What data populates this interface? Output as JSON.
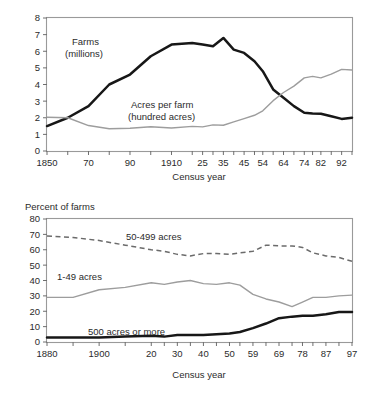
{
  "chart_data": [
    {
      "id": "farms-and-acres",
      "type": "line",
      "title": "",
      "xlabel": "Census year",
      "ylabel": "",
      "xlim": [
        1850,
        1997
      ],
      "ylim": [
        0,
        8
      ],
      "yticks": [
        0,
        1,
        2,
        3,
        4,
        5,
        6,
        7,
        8
      ],
      "ytick_labels": [
        "0",
        "1",
        "2",
        "3",
        "4",
        "5",
        "6",
        "7",
        "8"
      ],
      "xtick_values": [
        1850,
        1860,
        1870,
        1880,
        1890,
        1900,
        1910,
        1920,
        1925,
        1930,
        1935,
        1940,
        1945,
        1950,
        1954,
        1959,
        1964,
        1969,
        1974,
        1978,
        1982,
        1987,
        1992,
        1997
      ],
      "xtick_labels": [
        "1850",
        "",
        "70",
        "",
        "90",
        "",
        "1910",
        "",
        "25",
        "",
        "35",
        "",
        "45",
        "",
        "54",
        "",
        "64",
        "",
        "74",
        "",
        "82",
        "",
        "92",
        ""
      ],
      "grid": false,
      "legend_position": "inline-annotation",
      "series": [
        {
          "name": "Farms (millions)",
          "style": "thick-dark",
          "label_line1": "Farms",
          "label_line2": "(millions)",
          "x": [
            1850,
            1860,
            1870,
            1880,
            1890,
            1900,
            1910,
            1920,
            1925,
            1930,
            1935,
            1940,
            1945,
            1950,
            1954,
            1959,
            1964,
            1969,
            1974,
            1978,
            1982,
            1987,
            1992,
            1997
          ],
          "values": [
            1.5,
            2.0,
            2.7,
            4.0,
            4.6,
            5.7,
            6.4,
            6.5,
            6.4,
            6.3,
            6.8,
            6.1,
            5.9,
            5.4,
            4.8,
            3.7,
            3.2,
            2.7,
            2.3,
            2.26,
            2.24,
            2.09,
            1.93,
            2.0
          ]
        },
        {
          "name": "Acres per farm (hundred acres)",
          "style": "thin-gray",
          "label_line1": "Acres per farm",
          "label_line2": "(hundred acres)",
          "x": [
            1850,
            1860,
            1870,
            1880,
            1890,
            1900,
            1910,
            1920,
            1925,
            1930,
            1935,
            1940,
            1945,
            1950,
            1954,
            1959,
            1964,
            1969,
            1974,
            1978,
            1982,
            1987,
            1992,
            1997
          ],
          "values": [
            2.03,
            2.0,
            1.53,
            1.34,
            1.37,
            1.46,
            1.38,
            1.48,
            1.45,
            1.57,
            1.55,
            1.75,
            1.95,
            2.15,
            2.42,
            3.03,
            3.52,
            3.9,
            4.4,
            4.49,
            4.4,
            4.62,
            4.91,
            4.87
          ]
        }
      ]
    },
    {
      "id": "percent-of-farms-by-size",
      "type": "line",
      "title": "Percent of farms",
      "xlabel": "Census year",
      "ylabel": "",
      "xlim": [
        1880,
        1997
      ],
      "ylim": [
        0,
        80
      ],
      "yticks": [
        0,
        10,
        20,
        30,
        40,
        50,
        60,
        70,
        80
      ],
      "ytick_labels": [
        "0",
        "10",
        "20",
        "30",
        "40",
        "50",
        "60",
        "70",
        "80"
      ],
      "xtick_values": [
        1880,
        1890,
        1900,
        1910,
        1920,
        1925,
        1930,
        1935,
        1940,
        1945,
        1950,
        1954,
        1959,
        1964,
        1969,
        1974,
        1978,
        1982,
        1987,
        1992,
        1997
      ],
      "xtick_labels": [
        "1880",
        "",
        "1900",
        "",
        "20",
        "",
        "30",
        "",
        "40",
        "",
        "50",
        "",
        "59",
        "",
        "69",
        "",
        "78",
        "",
        "87",
        "",
        "97"
      ],
      "grid": false,
      "legend_position": "inline-annotation",
      "series": [
        {
          "name": "50-499 acres",
          "style": "dashed",
          "label": "50-499 acres",
          "x": [
            1880,
            1890,
            1900,
            1910,
            1920,
            1925,
            1930,
            1935,
            1940,
            1945,
            1950,
            1954,
            1959,
            1964,
            1969,
            1974,
            1978,
            1982,
            1987,
            1992,
            1997
          ],
          "values": [
            69,
            68,
            66,
            63,
            60,
            59,
            57,
            56,
            57.5,
            57.5,
            57,
            58,
            59,
            63,
            62.5,
            62.5,
            61.5,
            58,
            56,
            55,
            52.5
          ]
        },
        {
          "name": "1-49 acres",
          "style": "thin-gray",
          "label": "1-49 acres",
          "x": [
            1880,
            1890,
            1900,
            1910,
            1920,
            1925,
            1930,
            1935,
            1940,
            1945,
            1950,
            1954,
            1959,
            1964,
            1969,
            1974,
            1978,
            1982,
            1987,
            1992,
            1997
          ],
          "values": [
            29,
            29,
            34,
            35.5,
            38.5,
            37.5,
            39,
            40,
            38,
            37.5,
            38.5,
            37,
            31,
            28,
            26,
            23,
            26,
            29,
            29,
            30,
            30.5
          ]
        },
        {
          "name": "500 acres or more",
          "style": "thick-dark",
          "label": "500 acres or more",
          "x": [
            1880,
            1890,
            1900,
            1910,
            1920,
            1925,
            1930,
            1935,
            1940,
            1945,
            1950,
            1954,
            1959,
            1964,
            1969,
            1974,
            1978,
            1982,
            1987,
            1992,
            1997
          ],
          "values": [
            3,
            3,
            3,
            3.5,
            4,
            3.5,
            4.5,
            4.5,
            4.5,
            5,
            5.5,
            6.5,
            9,
            12,
            15.5,
            16.5,
            17,
            17,
            18,
            19.5,
            19.5
          ]
        }
      ]
    }
  ]
}
